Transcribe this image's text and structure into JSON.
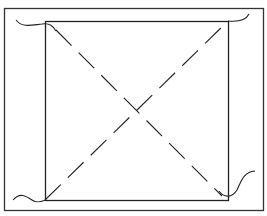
{
  "diagram": {
    "stroke_color": "#222222",
    "background": "#ffffff",
    "outer_frame": {
      "x": 4,
      "y": 8,
      "w": 260,
      "h": 203
    },
    "inner_square": {
      "x": 45,
      "y": 21,
      "w": 183,
      "h": 179
    },
    "diagonals": [
      {
        "from": [
          45,
          200
        ],
        "to": [
          228,
          21
        ],
        "style": "dashed"
      },
      {
        "from": [
          45,
          21
        ],
        "to": [
          228,
          200
        ],
        "style": "dashed"
      }
    ],
    "corner_squiggles": [
      "top-left",
      "top-right",
      "bottom-left",
      "bottom-right"
    ]
  }
}
